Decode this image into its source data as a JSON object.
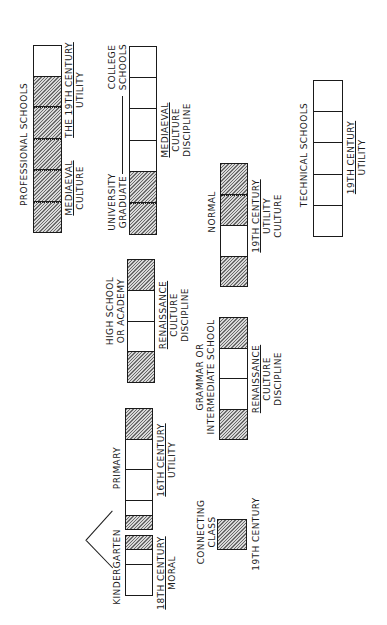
{
  "diagram": {
    "type": "educational-system-chart",
    "orientation": "rotated-90-ccw",
    "legend_colors": {
      "hatched": "#8a8a8a",
      "plain": "#ffffff",
      "stroke": "#1a1a1a"
    },
    "blocks": [
      {
        "id": "professional-schools",
        "title": "PROFESSIONAL  SCHOOLS",
        "notes": [
          {
            "lines": [
              "MEDIAEVAL",
              "CULTURE"
            ],
            "underline_first": true
          },
          {
            "lines": [
              "THE 19TH CENTURY",
              "UTILITY"
            ],
            "underline_first": true
          }
        ],
        "cells": [
          "plain",
          "hatched",
          "hatched",
          "hatched",
          "hatched",
          "hatched"
        ]
      },
      {
        "id": "college-schools",
        "title": "COLLEGE SCHOOLS",
        "title_lines": [
          "COLLEGE",
          "SCHOOLS"
        ],
        "secondary_label": [
          "UNIVERSITY",
          "GRADUATE"
        ],
        "notes": [
          {
            "lines": [
              "MEDIAEVAL",
              "CULTURE",
              "DISCIPLINE"
            ],
            "underline_first": true
          }
        ],
        "cells": [
          "plain",
          "plain",
          "plain",
          "plain",
          "hatched",
          "hatched"
        ]
      },
      {
        "id": "technical-schools",
        "title": "TECHNICAL  SCHOOLS",
        "notes": [
          {
            "lines": [
              "19TH  CENTURY",
              "UTILITY"
            ],
            "underline_first": true
          }
        ],
        "cells": [
          "plain",
          "plain",
          "plain",
          "plain",
          "plain"
        ]
      },
      {
        "id": "high-school",
        "title_lines": [
          "HIGH SCHOOL",
          "OR ACADEMY"
        ],
        "notes": [
          {
            "lines": [
              "RENAISSANCE",
              "CULTURE",
              "DISCIPLINE"
            ],
            "underline_first": true
          }
        ],
        "cells": [
          "hatched",
          "plain",
          "plain",
          "hatched"
        ]
      },
      {
        "id": "normal",
        "title_lines": [
          "NORMAL"
        ],
        "notes": [
          {
            "lines": [
              "19TH  CENTURY",
              "UTILITY",
              "CULTURE"
            ],
            "underline_first": true
          }
        ],
        "cells": [
          "hatched",
          "hatched",
          "plain",
          "hatched"
        ]
      },
      {
        "id": "grammar-school",
        "title_lines": [
          "GRAMMAR  OR",
          "INTERMEDIATE  SCHOOL"
        ],
        "notes": [
          {
            "lines": [
              "RENAISSANCE",
              "CULTURE",
              "DISCIPLINE"
            ],
            "underline_first": true
          }
        ],
        "cells": [
          "hatched",
          "plain",
          "plain",
          "hatched"
        ]
      },
      {
        "id": "primary",
        "title_lines": [
          "PRIMARY"
        ],
        "notes": [
          {
            "lines": [
              "16TH  CENTURY",
              "UTILITY"
            ],
            "underline_first": true
          }
        ],
        "cells": [
          "hatched",
          "plain",
          "plain",
          "plain",
          "hatched"
        ]
      },
      {
        "id": "kindergarten",
        "title_lines": [
          "KINDERGARTEN"
        ],
        "notes": [
          {
            "lines": [
              "18TH  CENTURY",
              "MORAL"
            ],
            "underline_first": true
          }
        ],
        "cells": [
          "hatched",
          "plain",
          "plain"
        ]
      },
      {
        "id": "connecting-class",
        "title_lines": [
          "CONNECTING",
          "CLASS"
        ],
        "notes": [
          {
            "lines": [
              "19TH  CENTURY"
            ],
            "underline_first": false
          }
        ],
        "cells": [
          "hatched"
        ]
      }
    ]
  }
}
